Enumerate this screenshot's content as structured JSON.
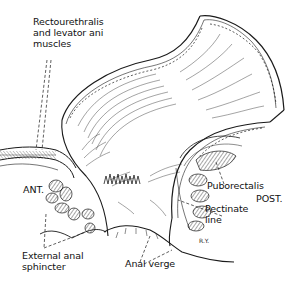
{
  "figure": {
    "labels": {
      "rectourethralis": "Rectourethralis\nand levator ani\nmuscles",
      "ant": "ANT.",
      "external_anal_sphincter": "External anal\nsphincter",
      "anal_verge": "Anal verge",
      "puborectalis": "Puborectalis",
      "post": "POST.",
      "pectinate_line": "Pectinate\nline",
      "artist_signature": "R.Y."
    },
    "colors": {
      "ink": "#1a1a1a",
      "background": "#ffffff"
    }
  }
}
